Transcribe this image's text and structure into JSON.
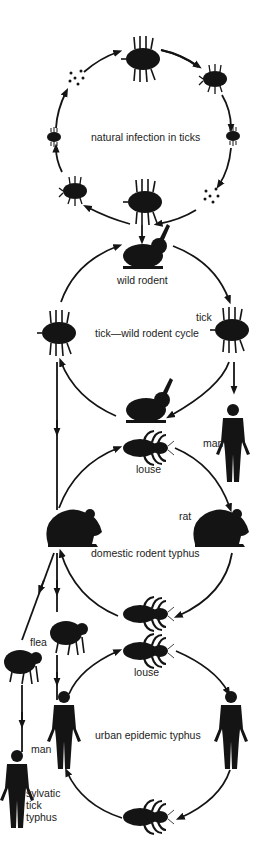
{
  "colors": {
    "ink": "#141414",
    "background": "#ffffff",
    "label": "#222222"
  },
  "cycles": [
    {
      "id": "natural-infection",
      "label": "natural infection in ticks",
      "nodes": [
        "tick (adult)",
        "tick nymph",
        "tick larva",
        "eggs",
        "tick (adult)",
        "tick nymph",
        "tick larva",
        "eggs"
      ]
    },
    {
      "id": "tick-wild-rodent",
      "label": "tick—wild rodent cycle",
      "nodes": [
        "wild rodent",
        "tick",
        "wild rodent",
        "tick"
      ]
    },
    {
      "id": "domestic-rodent",
      "label": "domestic rodent typhus",
      "nodes": [
        "louse",
        "rat",
        "louse",
        "rat"
      ]
    },
    {
      "id": "urban-epidemic",
      "label": "urban epidemic typhus",
      "nodes": [
        "louse",
        "man",
        "louse",
        "man"
      ]
    }
  ],
  "labels": {
    "wild_rodent": "wild rodent",
    "tick": "tick",
    "man_right": "man",
    "louse_top": "louse",
    "rat": "rat",
    "flea": "flea",
    "louse_urban": "louse",
    "man_left": "man",
    "sylvatic": "sylvatic\ntick\ntyphus",
    "sylvatic_lines": [
      "sylvatic",
      "tick",
      "typhus"
    ]
  }
}
